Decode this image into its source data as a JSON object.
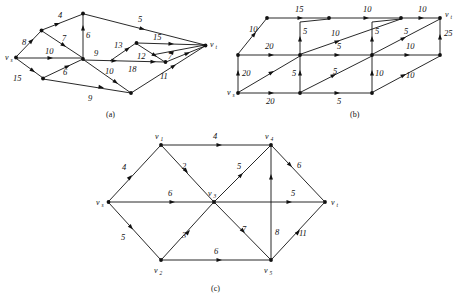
{
  "page": {
    "background": "#ffffff",
    "ink": "#111111"
  },
  "figures": [
    {
      "id": "a",
      "caption": "(a)",
      "vertices": [
        {
          "name": "vs",
          "label": "v",
          "sub": "s",
          "x": 16,
          "y": 57
        },
        {
          "name": "n_upper_left",
          "label": "",
          "sub": "",
          "x": 41,
          "y": 30
        },
        {
          "name": "n_top",
          "label": "",
          "sub": "",
          "x": 83,
          "y": 13
        },
        {
          "name": "n_center",
          "label": "",
          "sub": "",
          "x": 83,
          "y": 58
        },
        {
          "name": "n_lower_left",
          "label": "",
          "sub": "",
          "x": 43,
          "y": 78
        },
        {
          "name": "n_bottom",
          "label": "",
          "sub": "",
          "x": 131,
          "y": 93
        },
        {
          "name": "n_mid_upper",
          "label": "",
          "sub": "",
          "x": 136,
          "y": 43
        },
        {
          "name": "n_mid_right",
          "label": "",
          "sub": "",
          "x": 165,
          "y": 62
        },
        {
          "name": "vt",
          "label": "v",
          "sub": "t",
          "x": 206,
          "y": 45
        }
      ],
      "edges": [
        {
          "from": "vs",
          "to": "n_upper_left",
          "capacity": "8"
        },
        {
          "from": "n_upper_left",
          "to": "n_top",
          "capacity": "4"
        },
        {
          "from": "n_top",
          "to": "n_center",
          "capacity": "6"
        },
        {
          "from": "n_top",
          "to": "vt",
          "capacity": "5"
        },
        {
          "from": "vs",
          "to": "n_center",
          "capacity": "10"
        },
        {
          "from": "n_upper_left",
          "to": "n_center",
          "capacity": "7"
        },
        {
          "from": "vs",
          "to": "n_lower_left",
          "capacity": "15"
        },
        {
          "from": "n_lower_left",
          "to": "n_center",
          "capacity": "6"
        },
        {
          "from": "n_lower_left",
          "to": "n_bottom",
          "capacity": "9"
        },
        {
          "from": "n_center",
          "to": "n_mid_right",
          "capacity": "9"
        },
        {
          "from": "n_center",
          "to": "n_bottom",
          "capacity": "10"
        },
        {
          "from": "n_center",
          "to": "n_mid_upper",
          "capacity": "13"
        },
        {
          "from": "n_mid_upper",
          "to": "vt",
          "capacity": "15"
        },
        {
          "from": "n_mid_upper",
          "to": "n_mid_right",
          "capacity": "12"
        },
        {
          "from": "n_center",
          "to": "n_mid_right",
          "capacity": "18"
        },
        {
          "from": "n_mid_right",
          "to": "vt",
          "capacity": "7"
        },
        {
          "from": "n_bottom",
          "to": "vt",
          "capacity": "11"
        }
      ]
    },
    {
      "id": "b",
      "caption": "(b)",
      "vertices": [
        {
          "name": "vs",
          "label": "v",
          "sub": "s",
          "x": 238,
          "y": 93
        },
        {
          "name": "b_mid_left",
          "label": "",
          "sub": "",
          "x": 238,
          "y": 55
        },
        {
          "name": "b_top_left",
          "label": "",
          "sub": "",
          "x": 267,
          "y": 18
        },
        {
          "name": "b_bot_c1",
          "label": "",
          "sub": "",
          "x": 300,
          "y": 93
        },
        {
          "name": "b_mid_c1",
          "label": "",
          "sub": "",
          "x": 300,
          "y": 55
        },
        {
          "name": "b_top_c1",
          "label": "",
          "sub": "",
          "x": 329,
          "y": 18
        },
        {
          "name": "b_bot_c2",
          "label": "",
          "sub": "",
          "x": 372,
          "y": 93
        },
        {
          "name": "b_mid_c2",
          "label": "",
          "sub": "",
          "x": 372,
          "y": 55
        },
        {
          "name": "b_top_c2",
          "label": "",
          "sub": "",
          "x": 401,
          "y": 18
        },
        {
          "name": "b_bot_c3",
          "label": "",
          "sub": "",
          "x": 440,
          "y": 55
        },
        {
          "name": "vt",
          "label": "v",
          "sub": "t",
          "x": 440,
          "y": 18
        }
      ],
      "edges": [
        {
          "from": "vs",
          "to": "b_mid_left",
          "capacity": "20"
        },
        {
          "from": "b_mid_left",
          "to": "b_top_left",
          "capacity": "10"
        },
        {
          "from": "vs",
          "to": "b_bot_c1",
          "capacity": "20"
        },
        {
          "from": "b_mid_left",
          "to": "b_mid_c1",
          "capacity": "20"
        },
        {
          "from": "b_top_left",
          "to": "b_top_c1",
          "capacity": "15"
        },
        {
          "from": "b_bot_c1",
          "to": "b_mid_c1",
          "capacity": "5"
        },
        {
          "from": "b_mid_c1",
          "to": "b_top_c1",
          "capacity": "5"
        },
        {
          "from": "b_bot_c1",
          "to": "b_bot_c2",
          "capacity": "5"
        },
        {
          "from": "b_mid_c1",
          "to": "b_mid_c2",
          "capacity": "5"
        },
        {
          "from": "b_top_c1",
          "to": "b_top_c2",
          "capacity": "10"
        },
        {
          "from": "b_bot_c1",
          "to": "b_mid_c2",
          "capacity": "5"
        },
        {
          "from": "b_mid_c1",
          "to": "b_top_c2",
          "capacity": "10"
        },
        {
          "from": "b_bot_c2",
          "to": "b_mid_c2",
          "capacity": "10"
        },
        {
          "from": "b_mid_c2",
          "to": "b_top_c2",
          "capacity": "5"
        },
        {
          "from": "b_mid_c2",
          "to": "b_bot_c3",
          "capacity": "10"
        },
        {
          "from": "b_top_c2",
          "to": "vt",
          "capacity": "10"
        },
        {
          "from": "b_mid_c2",
          "to": "vt",
          "capacity": "5"
        },
        {
          "from": "b_bot_c2",
          "to": "b_bot_c3",
          "capacity": "10"
        },
        {
          "from": "b_bot_c3",
          "to": "vt",
          "capacity": "25"
        }
      ]
    },
    {
      "id": "c",
      "caption": "(c)",
      "vertices": [
        {
          "name": "vs",
          "label": "v",
          "sub": "s",
          "x": 108,
          "y": 202
        },
        {
          "name": "v1",
          "label": "v",
          "sub": "1",
          "x": 161,
          "y": 145
        },
        {
          "name": "v2",
          "label": "v",
          "sub": "2",
          "x": 161,
          "y": 260
        },
        {
          "name": "v3",
          "label": "v",
          "sub": "3",
          "x": 214,
          "y": 202
        },
        {
          "name": "v4",
          "label": "v",
          "sub": "4",
          "x": 271,
          "y": 145
        },
        {
          "name": "v5",
          "label": "v",
          "sub": "5",
          "x": 271,
          "y": 260
        },
        {
          "name": "vt",
          "label": "v",
          "sub": "t",
          "x": 325,
          "y": 202
        }
      ],
      "edges": [
        {
          "from": "vs",
          "to": "v1",
          "capacity": "4"
        },
        {
          "from": "vs",
          "to": "v2",
          "capacity": "5"
        },
        {
          "from": "vs",
          "to": "v3",
          "capacity": "6"
        },
        {
          "from": "v1",
          "to": "v4",
          "capacity": "4"
        },
        {
          "from": "v1",
          "to": "v3",
          "capacity": "2"
        },
        {
          "from": "v2",
          "to": "v3",
          "capacity": "3"
        },
        {
          "from": "v2",
          "to": "v5",
          "capacity": "6"
        },
        {
          "from": "v3",
          "to": "v4",
          "capacity": "5"
        },
        {
          "from": "v3",
          "to": "v5",
          "capacity": "7"
        },
        {
          "from": "v3",
          "to": "vt",
          "capacity": "5"
        },
        {
          "from": "v4",
          "to": "vt",
          "capacity": "6"
        },
        {
          "from": "v5",
          "to": "v4",
          "capacity": "8"
        },
        {
          "from": "v5",
          "to": "vt",
          "capacity": "11"
        }
      ]
    }
  ],
  "labels": {
    "fig_a": "(a)",
    "fig_b": "(b)",
    "fig_c": "(c)",
    "a": {
      "e_vs_ul": "8",
      "e_ul_top": "4",
      "e_top_center": "6",
      "e_top_vt": "5",
      "e_vs_center": "10",
      "e_ul_center": "7",
      "e_vs_ll": "15",
      "e_ll_center": "6",
      "e_ll_bottom": "9",
      "e_center_right": "9",
      "e_center_bottom": "10",
      "e_center_midup": "13",
      "e_midup_vt": "15",
      "e_midup_midright": "12",
      "e_center_midright": "18",
      "e_midright_vt": "7",
      "e_bottom_vt": "11",
      "vs": "v",
      "vs_sub": "s",
      "vt": "v",
      "vt_sub": "t"
    },
    "b": {
      "e_vs_midleft": "20",
      "e_midleft_topleft": "10",
      "e_vs_botc1": "20",
      "e_midleft_midc1": "20",
      "e_topleft_topc1": "15",
      "e_botc1_midc1": "5",
      "e_midc1_topc1": "5",
      "e_botc1_botc2": "5",
      "e_midc1_midc2": "5",
      "e_topc1_topc2": "10",
      "e_botc1_midc2": "5",
      "e_midc1_topc2": "10",
      "e_botc2_midc2": "10",
      "e_midc2_topc2": "5",
      "e_midc2_botc3": "10",
      "e_topc2_vt": "10",
      "e_midc2_vt": "5",
      "e_botc2_botc3": "10",
      "e_botc3_vt": "25",
      "vs": "v",
      "vs_sub": "s",
      "vt": "v",
      "vt_sub": "t"
    },
    "c": {
      "e_vs_v1": "4",
      "e_vs_v2": "5",
      "e_vs_v3": "6",
      "e_v1_v4": "4",
      "e_v1_v3": "2",
      "e_v2_v3": "3",
      "e_v2_v5": "6",
      "e_v3_v4": "5",
      "e_v3_v5": "7",
      "e_v3_vt": "5",
      "e_v4_vt": "6",
      "e_v5_v4": "8",
      "e_v5_vt": "11",
      "vs": "v",
      "vs_sub": "s",
      "v1": "v",
      "v1_sub": "1",
      "v2": "v",
      "v2_sub": "2",
      "v3": "v",
      "v3_sub": "3",
      "v4": "v",
      "v4_sub": "4",
      "v5": "v",
      "v5_sub": "5",
      "vt": "v",
      "vt_sub": "t"
    }
  }
}
